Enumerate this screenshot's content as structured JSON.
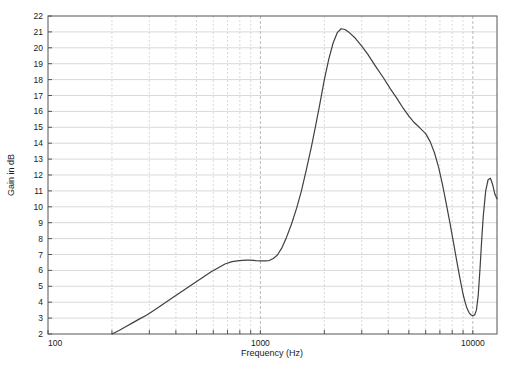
{
  "chart_data": {
    "type": "line",
    "title": "",
    "xlabel": "Frequency (Hz)",
    "ylabel": "Gain in dB",
    "xscale": "log",
    "yscale": "linear",
    "xlim": [
      100,
      13000
    ],
    "ylim": [
      2,
      22
    ],
    "grid": true,
    "grid_style": {
      "horizontal": "solid",
      "vertical": "dashed",
      "color": "#c8c8c8"
    },
    "legend": null,
    "line_color": "#404040",
    "line_width": 1.2,
    "xticks_major": [
      100,
      1000,
      10000
    ],
    "xticklabels_major": [
      "100",
      "1000",
      "10000"
    ],
    "xticks_minor": [
      200,
      300,
      400,
      500,
      600,
      700,
      800,
      900,
      2000,
      3000,
      4000,
      5000,
      6000,
      7000,
      8000,
      9000
    ],
    "yticks": [
      2,
      3,
      4,
      5,
      6,
      7,
      8,
      9,
      10,
      11,
      12,
      13,
      14,
      15,
      16,
      17,
      18,
      19,
      20,
      21,
      22
    ],
    "yticklabels": [
      "2",
      "3",
      "4",
      "5",
      "6",
      "7",
      "8",
      "9",
      "10",
      "11",
      "12",
      "13",
      "14",
      "15",
      "16",
      "17",
      "18",
      "19",
      "20",
      "21",
      "22"
    ],
    "series": [
      {
        "name": "gain-response",
        "x": [
          200,
          215,
          232,
          250,
          270,
          292,
          316,
          341,
          369,
          398,
          430,
          464,
          501,
          541,
          584,
          631,
          681,
          736,
          794,
          858,
          900,
          950,
          1000,
          1050,
          1100,
          1150,
          1200,
          1260,
          1320,
          1400,
          1480,
          1560,
          1650,
          1740,
          1820,
          1900,
          2000,
          2100,
          2200,
          2300,
          2400,
          2500,
          2600,
          2800,
          3000,
          3200,
          3500,
          3800,
          4100,
          4400,
          4700,
          5000,
          5300,
          5600,
          6000,
          6300,
          6600,
          6900,
          7200,
          7500,
          7800,
          8100,
          8400,
          8700,
          9000,
          9200,
          9400,
          9600,
          9800,
          10000,
          10200,
          10400,
          10600,
          10800,
          11000,
          11200,
          11500,
          11800,
          12100,
          12400,
          12700,
          13000
        ],
        "y": [
          2.0,
          2.2,
          2.45,
          2.7,
          2.95,
          3.2,
          3.5,
          3.8,
          4.1,
          4.4,
          4.7,
          5.0,
          5.3,
          5.6,
          5.9,
          6.15,
          6.4,
          6.55,
          6.62,
          6.65,
          6.65,
          6.62,
          6.6,
          6.6,
          6.62,
          6.75,
          6.95,
          7.4,
          8.0,
          8.9,
          9.9,
          11.0,
          12.4,
          13.8,
          15.1,
          16.4,
          18.0,
          19.3,
          20.3,
          20.95,
          21.2,
          21.15,
          21.0,
          20.6,
          20.1,
          19.6,
          18.8,
          18.1,
          17.4,
          16.8,
          16.2,
          15.7,
          15.3,
          15.0,
          14.6,
          14.1,
          13.4,
          12.5,
          11.4,
          10.2,
          9.0,
          7.8,
          6.6,
          5.5,
          4.5,
          4.0,
          3.6,
          3.35,
          3.2,
          3.15,
          3.2,
          3.5,
          4.4,
          6.0,
          7.8,
          9.4,
          11.0,
          11.7,
          11.8,
          11.4,
          10.8,
          10.5
        ],
        "notes": {
          "start_point": {
            "x": 200,
            "y": 2.0
          },
          "plateau": {
            "x_range": [
              800,
              1100
            ],
            "y": 6.6
          },
          "peak": {
            "x": 2400,
            "y": 21.2
          },
          "shoulder": {
            "x": 5600,
            "y": 15.0
          },
          "notch_minimum": {
            "x": 10000,
            "y": 3.15
          },
          "secondary_peak": {
            "x": 12100,
            "y": 11.8
          },
          "end_point": {
            "x": 13000,
            "y": 10.5
          }
        }
      }
    ]
  }
}
